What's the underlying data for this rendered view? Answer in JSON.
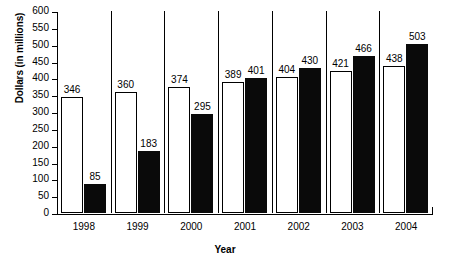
{
  "chart_data": {
    "type": "bar",
    "title": "",
    "xlabel": "Year",
    "ylabel": "Dollars (in millions)",
    "categories": [
      "1998",
      "1999",
      "2000",
      "2001",
      "2002",
      "2003",
      "2004"
    ],
    "series": [
      {
        "name": "white-series",
        "style": "white-filled-black-outline",
        "values": [
          346,
          360,
          374,
          389,
          404,
          421,
          438
        ]
      },
      {
        "name": "black-series",
        "style": "black-filled",
        "values": [
          85,
          183,
          295,
          401,
          430,
          466,
          503
        ]
      }
    ],
    "ylim": [
      0,
      600
    ],
    "ytick_step": 50,
    "yticks": [
      0,
      50,
      100,
      150,
      200,
      250,
      300,
      350,
      400,
      450,
      500,
      550,
      600
    ],
    "ytick_labels": [
      "0",
      "50",
      "100",
      "150",
      "200",
      "250",
      "300",
      "350",
      "400",
      "450",
      "500",
      "550",
      "600"
    ],
    "grid": false,
    "legend": "none",
    "data_labels": true,
    "colors": {
      "light_bar_fill": "#ffffff",
      "light_bar_stroke": "#000000",
      "dark_bar_fill": "#0a0a0a",
      "axis": "#000000",
      "text": "#000000",
      "background": "#ffffff"
    }
  }
}
